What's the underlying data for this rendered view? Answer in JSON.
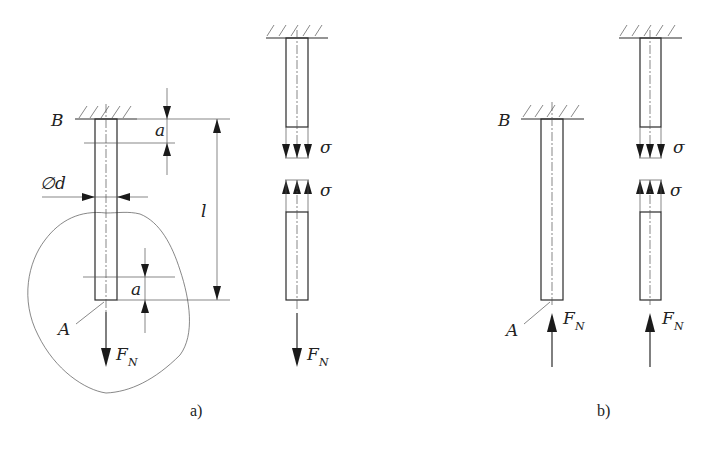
{
  "figure": {
    "panels": [
      {
        "id": "a",
        "caption": "a)",
        "load_direction": "tension",
        "main_view": {
          "support_label": "B",
          "end_label": "A",
          "force_label": "F",
          "force_subscript": "N",
          "diameter_label": "∅d",
          "length_label": "l",
          "top_offset_label": "a",
          "bottom_offset_label": "a"
        },
        "section_view": {
          "stress_label_upper": "σ",
          "stress_label_lower": "σ",
          "force_label": "F",
          "force_subscript": "N"
        }
      },
      {
        "id": "b",
        "caption": "b)",
        "load_direction": "compression",
        "main_view": {
          "support_label": "B",
          "end_label": "A",
          "force_label": "F",
          "force_subscript": "N"
        },
        "section_view": {
          "stress_label_upper": "σ",
          "stress_label_lower": "σ",
          "force_label": "F",
          "force_subscript": "N"
        }
      }
    ]
  },
  "colors": {
    "line": "#2a2a2a",
    "background": "#ffffff"
  }
}
